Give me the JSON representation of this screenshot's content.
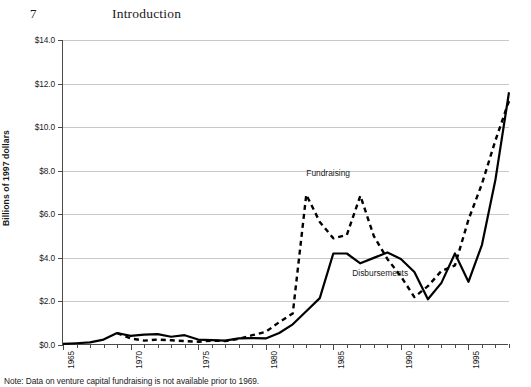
{
  "page": {
    "folio": "7",
    "running_title": "Introduction"
  },
  "note": "Note: Data on venture capital fundraising is not available prior to 1969.",
  "chart_data": {
    "type": "line",
    "title": "",
    "xlabel": "",
    "ylabel": "Billions of 1997 dollars",
    "xlim": [
      1965,
      1998
    ],
    "ylim": [
      0.0,
      14.0
    ],
    "ytick_values": [
      0.0,
      2.0,
      4.0,
      6.0,
      8.0,
      10.0,
      12.0,
      14.0
    ],
    "ytick_labels": [
      "$0.0",
      "$2.0",
      "$4.0",
      "$6.0",
      "$8.0",
      "$10.0",
      "$12.0",
      "$14.0"
    ],
    "xtick_values": [
      1965,
      1970,
      1975,
      1980,
      1985,
      1990,
      1995
    ],
    "xtick_labels": [
      "1965",
      "1970",
      "1975",
      "1980",
      "1985",
      "1990",
      "1995"
    ],
    "grid": "horizontal",
    "legend_position": "inline-annotations",
    "x": [
      1965,
      1966,
      1967,
      1968,
      1969,
      1970,
      1971,
      1972,
      1973,
      1974,
      1975,
      1976,
      1977,
      1978,
      1979,
      1980,
      1981,
      1982,
      1983,
      1984,
      1985,
      1986,
      1987,
      1988,
      1989,
      1990,
      1991,
      1992,
      1993,
      1994,
      1995,
      1996,
      1997,
      1998
    ],
    "series": [
      {
        "name": "Disbursements",
        "style": "solid",
        "color": "#000000",
        "values": [
          0.05,
          0.08,
          0.12,
          0.25,
          0.55,
          0.42,
          0.48,
          0.5,
          0.38,
          0.45,
          0.25,
          0.22,
          0.2,
          0.3,
          0.32,
          0.3,
          0.55,
          0.95,
          1.55,
          2.15,
          4.2,
          4.2,
          3.75,
          4.0,
          4.25,
          3.95,
          3.35,
          2.1,
          2.85,
          4.2,
          2.9,
          4.6,
          7.6,
          11.6
        ]
      },
      {
        "name": "Fundraising",
        "style": "dashed",
        "color": "#000000",
        "values": [
          null,
          null,
          null,
          null,
          0.55,
          0.3,
          0.2,
          0.25,
          0.22,
          0.18,
          0.15,
          0.2,
          0.18,
          0.28,
          0.45,
          0.6,
          1.05,
          1.45,
          6.9,
          5.65,
          4.9,
          5.05,
          6.85,
          5.0,
          3.95,
          3.15,
          2.2,
          2.7,
          3.4,
          3.65,
          5.75,
          7.4,
          9.4,
          11.2
        ]
      }
    ],
    "annotations": [
      {
        "text": "Fundraising",
        "x": 1983.0,
        "y": 7.85
      },
      {
        "text": "Disbursements",
        "x": 1986.4,
        "y": 3.25
      }
    ]
  },
  "axis_colors": {
    "axis": "#4a4a4a",
    "grid": "#c9c9c9",
    "series": "#000000"
  }
}
